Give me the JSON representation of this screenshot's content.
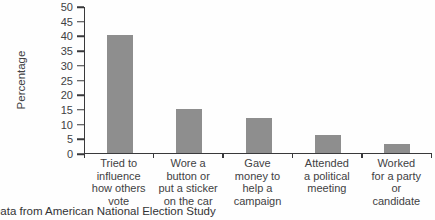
{
  "caption": "Data from American National Election Study",
  "chart_data": {
    "type": "bar",
    "title": "",
    "xlabel": "",
    "ylabel": "Percentage",
    "ylim": [
      0,
      50
    ],
    "ytick_step": 5,
    "grid": false,
    "legend": null,
    "bar_color": "#8e8e8e",
    "axis_color": "#39393b",
    "text_color": "#414143",
    "caption_color": "#333335",
    "categories": [
      {
        "label": "Tried to influence how others vote",
        "lines": [
          "Tried to",
          "influence",
          "how others",
          "vote"
        ]
      },
      {
        "label": "Wore a button or put a sticker on the car",
        "lines": [
          "Wore a",
          "button or",
          "put a sticker",
          "on the car"
        ]
      },
      {
        "label": "Gave money to help a campaign",
        "lines": [
          "Gave",
          "money to",
          "help a",
          "campaign"
        ]
      },
      {
        "label": "Attended a political meeting",
        "lines": [
          "Attended",
          "a political",
          "meeting"
        ]
      },
      {
        "label": "Worked for a party or candidate",
        "lines": [
          "Worked",
          "for a party",
          "or",
          "candidate"
        ]
      }
    ],
    "values": [
      40,
      15,
      12,
      6,
      3
    ]
  }
}
